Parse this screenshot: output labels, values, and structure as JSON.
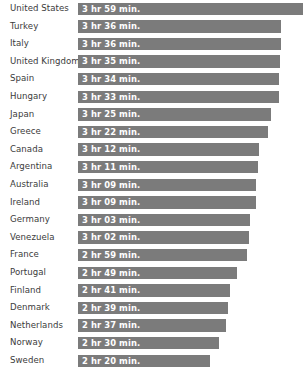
{
  "chart_data": {
    "type": "bar",
    "title": "",
    "subtitle": "",
    "xlabel": "",
    "ylabel": "",
    "orientation": "horizontal",
    "grid": false,
    "legend": "none",
    "axis_visible": false,
    "xlim": [
      0,
      239
    ],
    "unit": "minutes",
    "bar_color": "#7b7b7b",
    "value_label_color": "#ffffff",
    "category_label_color": "#3b3b3b",
    "background_color": "#ffffff",
    "categories": [
      "United States",
      "Turkey",
      "Italy",
      "United Kingdom",
      "Spain",
      "Hungary",
      "Japan",
      "Greece",
      "Canada",
      "Argentina",
      "Australia",
      "Ireland",
      "Germany",
      "Venezuela",
      "France",
      "Portugal",
      "Finland",
      "Denmark",
      "Netherlands",
      "Norway",
      "Sweden"
    ],
    "values": [
      239,
      216,
      216,
      215,
      214,
      213,
      205,
      202,
      192,
      191,
      189,
      189,
      183,
      182,
      179,
      169,
      161,
      159,
      157,
      150,
      140
    ],
    "value_labels": [
      "3 hr 59 min.",
      "3 hr 36 min.",
      "3 hr 36 min.",
      "3 hr 35 min.",
      "3 hr 34 min.",
      "3 hr 33 min.",
      "3 hr 25 min.",
      "3 hr 22 min.",
      "3 hr 12 min.",
      "3 hr 11 min.",
      "3 hr 09 min.",
      "3 hr 09 min.",
      "3 hr 03 min.",
      "3 hr 02 min.",
      "2 hr 59 min.",
      "2 hr 49 min.",
      "2 hr 41 min.",
      "2 hr 39 min.",
      "2 hr 37 min.",
      "2 hr 30 min.",
      "2 hr 20 min."
    ]
  },
  "layout": {
    "row_pitch": 17.6,
    "row_top_offset": 0,
    "bar_left": 78,
    "bar_height": 12.4,
    "plot_width": 225
  }
}
